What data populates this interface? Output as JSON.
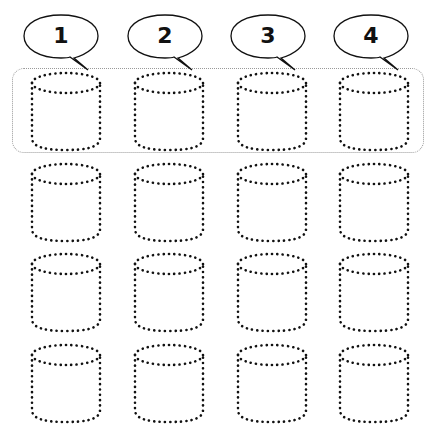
{
  "worksheet": {
    "labels": [
      "1",
      "2",
      "3",
      "4"
    ],
    "grid": {
      "rows": 4,
      "columns": 4
    },
    "highlighted_row": 1,
    "dot_color": "#111111",
    "frame_color": "#999999"
  }
}
